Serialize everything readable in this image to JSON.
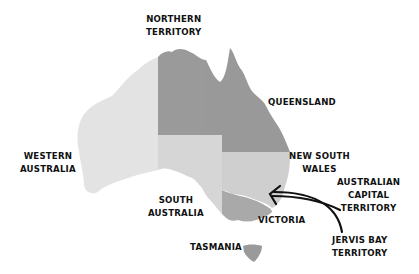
{
  "map": {
    "title": "Australia States and Territories",
    "colors": {
      "western_australia": "#e3e3e3",
      "northern_territory": "#9a9a9a",
      "queensland": "#999999",
      "south_australia": "#d6d6d6",
      "new_south_wales": "#cfcfcf",
      "victoria": "#a9a9a9",
      "tasmania": "#9a9a9a",
      "label_text": "#111111",
      "arrow": "#111111",
      "background": "#ffffff"
    },
    "labels": {
      "northern_territory": [
        "NORTHERN",
        "TERRITORY"
      ],
      "queensland": [
        "QUEENSLAND"
      ],
      "western_australia": [
        "WESTERN",
        "AUSTRALIA"
      ],
      "new_south_wales": [
        "NEW SOUTH",
        "WALES"
      ],
      "australian_capital_territory": [
        "AUSTRALIAN",
        "CAPITAL",
        "TERRITORY"
      ],
      "south_australia": [
        "SOUTH",
        "AUSTRALIA"
      ],
      "victoria": [
        "VICTORIA"
      ],
      "tasmania": [
        "TASMANIA"
      ],
      "jervis_bay_territory": [
        "JERVIS BAY",
        "TERRITORY"
      ]
    }
  }
}
